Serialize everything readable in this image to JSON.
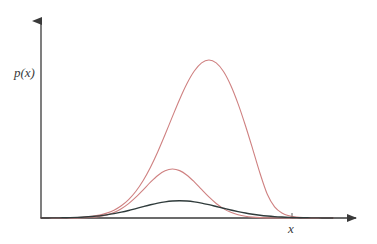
{
  "figure": {
    "title": "",
    "background_color": "#ffffff",
    "width": 377,
    "height": 244
  },
  "axes": {
    "x_axis": {
      "label": "x",
      "origin_px": [
        41,
        218
      ],
      "end_px": [
        363,
        218
      ],
      "has_arrowhead": true,
      "color": "#3a3a3a",
      "tick_marker_px": 292
    },
    "y_axis": {
      "label": "p(x)",
      "origin_px": [
        41,
        218
      ],
      "end_px": [
        41,
        14
      ],
      "has_arrowhead": true,
      "color": "#3a3a3a"
    },
    "grid": false,
    "tick_labels": []
  },
  "legend": {
    "visible": false,
    "entries": []
  },
  "chart_data": {
    "type": "line",
    "title": "",
    "xlabel": "x",
    "ylabel": "p(x)",
    "grid": false,
    "legend_position": "none",
    "xlim": [
      0,
      10
    ],
    "ylim": [
      0,
      1
    ],
    "x": [
      0.0,
      0.2,
      0.4,
      0.6,
      0.8,
      1.0,
      1.2,
      1.4,
      1.6,
      1.8,
      2.0,
      2.2,
      2.4,
      2.6,
      2.8,
      3.0,
      3.2,
      3.4,
      3.6,
      3.8,
      4.0,
      4.2,
      4.4,
      4.6,
      4.8,
      5.0,
      5.2,
      5.4,
      5.6,
      5.8,
      6.0,
      6.2,
      6.4,
      6.6,
      6.8,
      7.0,
      7.2,
      7.4,
      7.6,
      7.8,
      8.0
    ],
    "series": [
      {
        "name": "broad-density",
        "color": "#2f3b3b",
        "line_width": 1.4,
        "peak_x": 4.1,
        "peak_y": 0.456,
        "sigma": 1.28,
        "values": [
          0.0011,
          0.0022,
          0.0042,
          0.0076,
          0.0132,
          0.022,
          0.0354,
          0.0549,
          0.082,
          0.1182,
          0.1643,
          0.2203,
          0.285,
          0.356,
          0.4293,
          0.4999,
          0.5622,
          0.6108,
          0.6415,
          0.6515,
          0.6403,
          0.6092,
          0.5617,
          0.5022,
          0.436,
          0.3681,
          0.3025,
          0.242,
          0.1882,
          0.1424,
          0.1048,
          0.0751,
          0.0524,
          0.0356,
          0.0235,
          0.0151,
          0.0095,
          0.0058,
          0.0035,
          0.002,
          0.0011
        ]
      },
      {
        "name": "tall-density",
        "color": "#cf8181",
        "line_width": 1.1,
        "peak_x": 4.0,
        "peak_y": 1.0,
        "sigma": 0.95,
        "values": [
          0.0,
          0.0001,
          0.0003,
          0.0009,
          0.0024,
          0.006,
          0.014,
          0.0305,
          0.062,
          0.1178,
          0.2093,
          0.3479,
          0.5403,
          0.7847,
          1.0653,
          1.3522,
          1.6055,
          1.7828,
          1.8494,
          1.788,
          1.6149,
          1.3639,
          1.0774,
          0.7953,
          0.5489,
          0.3543,
          0.2139,
          0.1208,
          0.0638,
          0.0315,
          0.0146,
          0.0063,
          0.0025,
          0.001,
          0.0004,
          0.0001,
          0.0,
          0.0,
          0.0,
          0.0,
          0.0
        ]
      },
      {
        "name": "narrow-density",
        "color": "#cf8181",
        "line_width": 1.1,
        "peak_x": 4.25,
        "peak_y": 0.68,
        "sigma": 0.62,
        "values": [
          0.0005,
          0.0011,
          0.0024,
          0.0049,
          0.0098,
          0.0189,
          0.0352,
          0.0633,
          0.1098,
          0.1838,
          0.2968,
          0.4627,
          0.6961,
          1.011,
          1.4174,
          1.9175,
          2.5024,
          3.1502,
          3.8258,
          4.4841,
          5.0746,
          5.5463,
          5.8539,
          5.9632,
          5.8552,
          5.5292,
          5.0027,
          4.3089,
          3.492,
          2.6016,
          1.6879,
          0.8969,
          0.4217,
          0.1902,
          0.0826,
          0.0346,
          0.014,
          0.0054,
          0.002,
          0.0007,
          0.0003
        ]
      }
    ]
  }
}
